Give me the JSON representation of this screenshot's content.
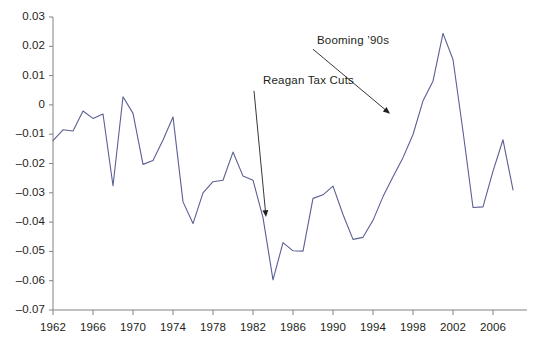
{
  "chart_data": {
    "type": "line",
    "title": "",
    "subtitle": "",
    "xlabel": "",
    "ylabel": "",
    "grid": false,
    "legend": false,
    "xlim": [
      1962,
      2008
    ],
    "ylim": [
      -0.07,
      0.03
    ],
    "ytick_values": [
      0.03,
      0.02,
      0.01,
      0,
      -0.01,
      -0.02,
      -0.03,
      -0.04,
      -0.05,
      -0.06,
      -0.07
    ],
    "ytick_labels": [
      "0.03",
      "0.02",
      "0.01",
      "0",
      "–0.01",
      "–0.02",
      "–0.03",
      "–0.04",
      "–0.05",
      "–0.06",
      "–0.07"
    ],
    "xtick_values": [
      1962,
      1966,
      1970,
      1974,
      1978,
      1982,
      1986,
      1990,
      1994,
      1998,
      2002,
      2006
    ],
    "xtick_labels": [
      "1962",
      "1966",
      "1970",
      "1974",
      "1978",
      "1982",
      "1986",
      "1990",
      "1994",
      "1998",
      "2002",
      "2006"
    ],
    "series": [
      {
        "name": "series-1",
        "color": "#5b5f93",
        "x": [
          1962,
          1963,
          1964,
          1965,
          1966,
          1967,
          1968,
          1969,
          1970,
          1971,
          1972,
          1973,
          1974,
          1975,
          1976,
          1977,
          1978,
          1979,
          1980,
          1981,
          1982,
          1983,
          1984,
          1985,
          1986,
          1987,
          1988,
          1989,
          1990,
          1991,
          1992,
          1993,
          1994,
          1995,
          1996,
          1997,
          1998,
          1999,
          2000,
          2001,
          2002,
          2003,
          2004,
          2005,
          2006,
          2007,
          2008
        ],
        "values": [
          -0.0122,
          -0.0085,
          -0.0089,
          -0.0021,
          -0.0046,
          -0.0031,
          -0.0276,
          0.0028,
          -0.0029,
          -0.0203,
          -0.019,
          -0.012,
          -0.0041,
          -0.0331,
          -0.0405,
          -0.03,
          -0.0262,
          -0.0257,
          -0.0161,
          -0.0243,
          -0.0257,
          -0.0385,
          -0.0597,
          -0.047,
          -0.0498,
          -0.0499,
          -0.0319,
          -0.0307,
          -0.0277,
          -0.0374,
          -0.0459,
          -0.0452,
          -0.0394,
          -0.0313,
          -0.0245,
          -0.018,
          -0.0101,
          0.0014,
          0.0081,
          0.0244,
          0.0155,
          -0.009,
          -0.035,
          -0.0348,
          -0.0226,
          -0.0119,
          -0.029
        ]
      }
    ],
    "annotations": [
      {
        "id": "reagan-tax-cuts",
        "text": "Reagan Tax Cuts",
        "label_x": 1983.2,
        "label_y": 0.0078,
        "arrow_from_x": 1982.1,
        "arrow_from_y": 0.0048,
        "arrow_to_x": 1983.3,
        "arrow_to_y": -0.0383
      },
      {
        "id": "booming-90s",
        "text": "Booming ’90s",
        "label_x": 1988.6,
        "label_y": 0.0216,
        "arrow_from_x": 1988.0,
        "arrow_from_y": 0.019,
        "arrow_to_x": 1995.7,
        "arrow_to_y": -0.003
      }
    ],
    "axis_color": "#808285",
    "text_color": "#231f20"
  }
}
